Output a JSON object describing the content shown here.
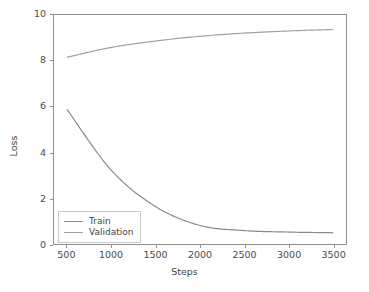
{
  "chart_data": {
    "type": "line",
    "title": "",
    "xlabel": "Steps",
    "ylabel": "Loss",
    "xlim": [
      350,
      3650
    ],
    "ylim": [
      -0.45,
      10.3
    ],
    "grid": false,
    "legend_position": "lower left",
    "x": [
      500,
      1000,
      1500,
      2000,
      2500,
      3000,
      3500
    ],
    "xticks": [
      "500",
      "1000",
      "1500",
      "2000",
      "2500",
      "3000",
      "3500"
    ],
    "yticks": [
      "0",
      "2",
      "4",
      "6",
      "8",
      "10"
    ],
    "series": [
      {
        "name": "Train",
        "color": "#8a8a8a",
        "values": [
          5.85,
          3.0,
          1.3,
          0.42,
          0.18,
          0.11,
          0.08
        ]
      },
      {
        "name": "Validation",
        "color": "#a0a0a0",
        "values": [
          8.32,
          8.78,
          9.08,
          9.3,
          9.45,
          9.55,
          9.62
        ]
      }
    ]
  },
  "legend": {
    "items": [
      {
        "label": "Train"
      },
      {
        "label": "Validation"
      }
    ]
  },
  "colors": {
    "background": "#ffffff",
    "axis": "#8f8f8f",
    "text": "#3f3f3f",
    "train": "#8a8a8a",
    "validation": "#a0a0a0"
  }
}
